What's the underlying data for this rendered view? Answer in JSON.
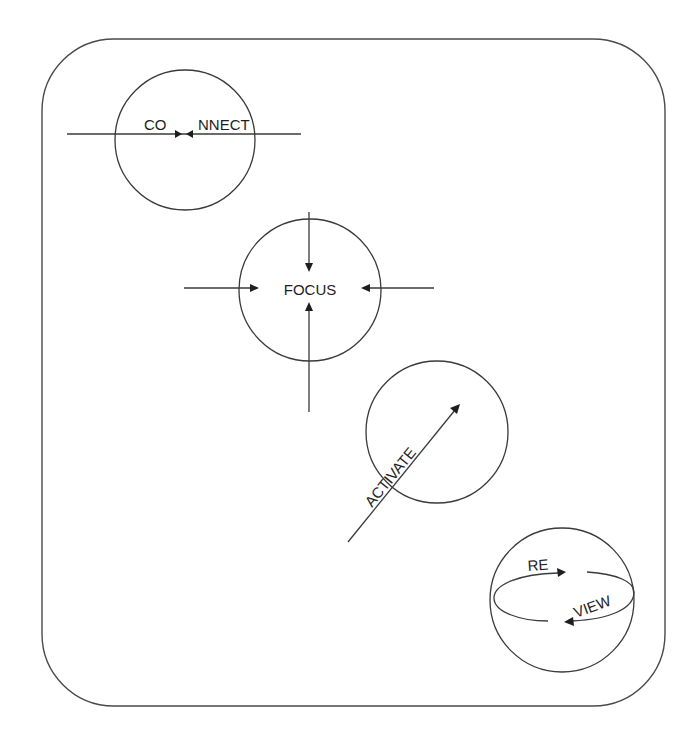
{
  "diagram": {
    "frame": {
      "x": 42,
      "y": 39,
      "width": 623,
      "height": 667,
      "radius": 72
    },
    "stroke_color": "#3a3a3a",
    "text_color": "#1e1e1e",
    "nodes": [
      {
        "id": "connect",
        "label_left": "CO",
        "label_right": "NNECT",
        "circle": {
          "cx": 185,
          "cy": 140,
          "r": 70
        },
        "description": "horizontal line with two arrows pointing toward each other in the middle of the word"
      },
      {
        "id": "focus",
        "label": "FOCUS",
        "circle": {
          "cx": 310,
          "cy": 290,
          "r": 71
        },
        "description": "four arrows from top, bottom, left and right pointing inward to the word"
      },
      {
        "id": "activate",
        "label": "ACTIVATE",
        "circle": {
          "cx": 437,
          "cy": 432,
          "r": 71
        },
        "description": "diagonal arrow pointing up-right with the word written along it"
      },
      {
        "id": "review",
        "label_top": "RE",
        "label_bottom": "VIEW",
        "circle": {
          "cx": 562,
          "cy": 600,
          "r": 72
        },
        "description": "circular looping arrow around an ellipse"
      }
    ]
  }
}
